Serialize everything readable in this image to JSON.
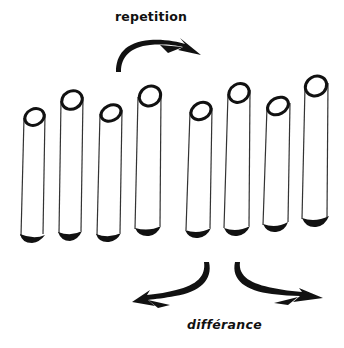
{
  "diagram": {
    "labels": {
      "top": "repetition",
      "bottom": "différance"
    },
    "colors": {
      "ink": "#111111",
      "outline": "#333333",
      "fill": "#ffffff",
      "background": "#ffffff"
    },
    "tubes": [
      {
        "id": 1,
        "top_cx": 34,
        "top_cy": 117,
        "bottom_y": 238
      },
      {
        "id": 2,
        "top_cx": 72,
        "top_cy": 100,
        "bottom_y": 235
      },
      {
        "id": 3,
        "top_cx": 111,
        "top_cy": 113,
        "bottom_y": 237
      },
      {
        "id": 4,
        "top_cx": 150,
        "top_cy": 96,
        "bottom_y": 231
      },
      {
        "id": 5,
        "top_cx": 201,
        "top_cy": 111,
        "bottom_y": 233
      },
      {
        "id": 6,
        "top_cx": 239,
        "top_cy": 93,
        "bottom_y": 231
      },
      {
        "id": 7,
        "top_cx": 278,
        "top_cy": 106,
        "bottom_y": 227
      },
      {
        "id": 8,
        "top_cx": 316,
        "top_cy": 86,
        "bottom_y": 222
      }
    ],
    "arrows": [
      {
        "name": "repetition-arrow",
        "direction": "up-right"
      },
      {
        "name": "differance-arrow-left",
        "direction": "down-left"
      },
      {
        "name": "differance-arrow-right",
        "direction": "down-right"
      }
    ]
  }
}
